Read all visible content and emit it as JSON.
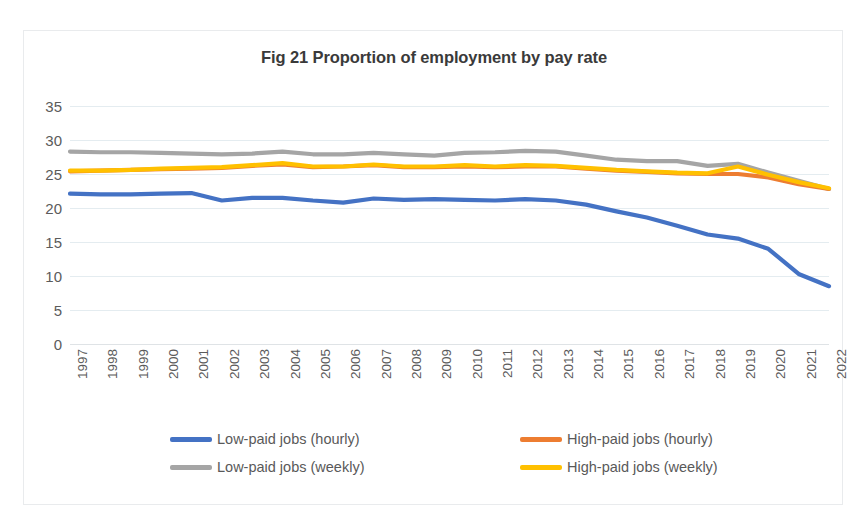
{
  "chart_data": {
    "type": "line",
    "title": "Fig 21 Proportion of employment by pay rate",
    "xlabel": "",
    "ylabel": "",
    "ylim": [
      0,
      35
    ],
    "yticks": [
      0,
      5,
      10,
      15,
      20,
      25,
      30,
      35
    ],
    "grid": true,
    "legend_position": "bottom",
    "x": [
      1997,
      1998,
      1999,
      2000,
      2001,
      2002,
      2003,
      2004,
      2005,
      2006,
      2007,
      2008,
      2009,
      2010,
      2011,
      2012,
      2013,
      2014,
      2015,
      2016,
      2017,
      2018,
      2019,
      2020,
      2021,
      2022
    ],
    "categories": [
      "1997",
      "1998",
      "1999",
      "2000",
      "2001",
      "2002",
      "2003",
      "2004",
      "2005",
      "2006",
      "2007",
      "2008",
      "2009",
      "2010",
      "2011",
      "2012",
      "2013",
      "2014",
      "2015",
      "2016",
      "2017",
      "2018",
      "2019",
      "2020",
      "2021",
      "2022"
    ],
    "series": [
      {
        "name": "Low-paid jobs (hourly)",
        "color": "#4472C4",
        "values": [
          22.1,
          22.0,
          22.0,
          22.1,
          22.2,
          21.1,
          21.5,
          21.5,
          21.1,
          20.8,
          21.4,
          21.2,
          21.3,
          21.2,
          21.1,
          21.3,
          21.1,
          20.5,
          19.5,
          18.6,
          17.4,
          16.1,
          15.5,
          14.0,
          10.3,
          8.5
        ]
      },
      {
        "name": "High-paid jobs (hourly)",
        "color": "#ED7D31",
        "values": [
          25.4,
          25.5,
          25.6,
          25.7,
          25.8,
          25.9,
          26.2,
          26.4,
          26.0,
          26.1,
          26.3,
          26.0,
          26.0,
          26.1,
          26.0,
          26.1,
          26.1,
          25.8,
          25.5,
          25.3,
          25.1,
          25.0,
          25.0,
          24.5,
          23.5,
          22.8
        ]
      },
      {
        "name": "Low-paid jobs (weekly)",
        "color": "#A5A5A5",
        "values": [
          28.3,
          28.2,
          28.2,
          28.1,
          28.0,
          27.9,
          28.0,
          28.3,
          27.9,
          27.9,
          28.1,
          27.9,
          27.7,
          28.1,
          28.2,
          28.4,
          28.3,
          27.7,
          27.1,
          26.9,
          26.9,
          26.2,
          26.5,
          25.2,
          24.0,
          22.8
        ]
      },
      {
        "name": "High-paid jobs (weekly)",
        "color": "#FFC000",
        "values": [
          25.5,
          25.5,
          25.6,
          25.8,
          25.9,
          26.0,
          26.3,
          26.6,
          26.1,
          26.1,
          26.4,
          26.1,
          26.1,
          26.3,
          26.1,
          26.3,
          26.2,
          25.9,
          25.6,
          25.4,
          25.2,
          25.1,
          26.1,
          24.9,
          23.8,
          22.9
        ]
      }
    ]
  },
  "legend": {
    "items": [
      {
        "label": "Low-paid jobs (hourly)",
        "color": "#4472C4"
      },
      {
        "label": "High-paid jobs (hourly)",
        "color": "#ED7D31"
      },
      {
        "label": "Low-paid jobs (weekly)",
        "color": "#A5A5A5"
      },
      {
        "label": "High-paid jobs (weekly)",
        "color": "#FFC000"
      }
    ]
  },
  "colors": {
    "background": "#ffffff",
    "border": "#e9ebed",
    "gridline": "#e4ecf0",
    "tick_text": "#5b5b5b",
    "title_text": "#3a3a3a"
  }
}
